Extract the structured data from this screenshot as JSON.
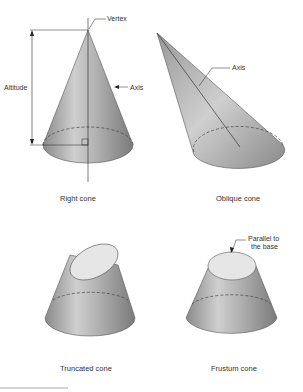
{
  "figure": {
    "panels": [
      {
        "name": "right-cone",
        "caption": "Right cone",
        "labels": {
          "vertex": "Vertex",
          "altitude": "Altitude",
          "axis": "Axis"
        }
      },
      {
        "name": "oblique-cone",
        "caption": "Oblique cone",
        "labels": {
          "axis": "Axis"
        }
      },
      {
        "name": "truncated-cone",
        "caption": "Truncated cone"
      },
      {
        "name": "frustum-cone",
        "caption": "Frustum cone",
        "labels": {
          "parallel_line1": "Parallel to",
          "parallel_line2": "the base"
        }
      }
    ]
  },
  "colors": {
    "cone_dark": "#7a7a7a",
    "cone_light": "#d6d6d6",
    "cut_face": "#e6e6e6",
    "line": "#222222"
  }
}
